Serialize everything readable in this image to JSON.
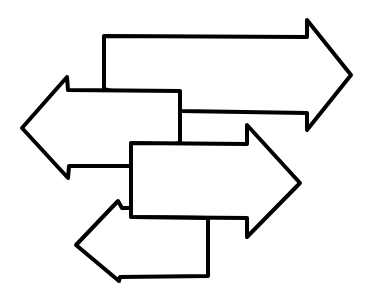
{
  "diagram": {
    "type": "overlapping-arrows",
    "background": "#ffffff",
    "stroke_color": "#000000",
    "fill_color": "#ffffff",
    "arrows": [
      {
        "name": "top-right-arrow",
        "direction": "right",
        "points": "104,89 104,36 307,37 307,20 351,75 307,130 307,113 180,111"
      },
      {
        "name": "upper-left-arrow",
        "direction": "left",
        "points": "180,142 180,91 68,90 67,77 22,128 68,178 69,166 131,166"
      },
      {
        "name": "middle-right-arrow",
        "direction": "right",
        "points": "131,143 247,144 247,125 300,183 247,237 247,218 131,217"
      },
      {
        "name": "bottom-left-arrow",
        "direction": "left",
        "points": "131,217 208,218 208,276 120,277 119,281 76,245 118,201 122,208 131,208"
      }
    ]
  }
}
